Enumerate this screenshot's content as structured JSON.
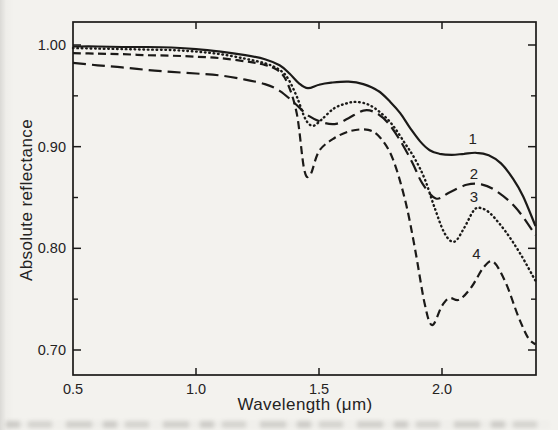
{
  "figure": {
    "kind": "scanned-journal-figure",
    "ink_color": "#1b1a18",
    "paper_color": "#f3f2ee"
  },
  "chart_data": {
    "type": "line",
    "title": "",
    "xlabel": "Wavelength (μm)",
    "ylabel": "Absolute reflectance",
    "xlim": [
      0.5,
      2.38
    ],
    "ylim": [
      0.675,
      1.023
    ],
    "grid": false,
    "legend_position": "inline-numbered-curve-labels",
    "x_ticks": {
      "labeled_values": [
        0.5,
        1.0,
        1.5,
        2.0
      ],
      "labels": [
        "0.5",
        "1.0",
        "1.5",
        "2.0"
      ],
      "mark_values": [
        1.0,
        1.5,
        2.0
      ],
      "marks_on": [
        "bottom",
        "top"
      ]
    },
    "y_ticks": {
      "labeled_values": [
        1.0,
        0.9,
        0.8,
        0.7
      ],
      "labels": [
        "1.00",
        "0.90",
        "0.80",
        "0.70"
      ],
      "minor_values": [
        0.95,
        0.85,
        0.75
      ],
      "marks_on": [
        "left",
        "right"
      ]
    },
    "series": [
      {
        "name": "1",
        "line_style": "solid",
        "label_pos": {
          "x": 2.125,
          "y": 0.9075
        },
        "points": [
          [
            0.5,
            0.9985
          ],
          [
            0.6,
            0.9985
          ],
          [
            0.7,
            0.998
          ],
          [
            0.8,
            0.998
          ],
          [
            0.9,
            0.9975
          ],
          [
            1.0,
            0.996
          ],
          [
            1.1,
            0.9935
          ],
          [
            1.2,
            0.99
          ],
          [
            1.28,
            0.986
          ],
          [
            1.34,
            0.98
          ],
          [
            1.38,
            0.972
          ],
          [
            1.42,
            0.962
          ],
          [
            1.455,
            0.9575
          ],
          [
            1.5,
            0.961
          ],
          [
            1.55,
            0.963
          ],
          [
            1.62,
            0.964
          ],
          [
            1.68,
            0.9615
          ],
          [
            1.74,
            0.955
          ],
          [
            1.79,
            0.944
          ],
          [
            1.83,
            0.933
          ],
          [
            1.87,
            0.9185
          ],
          [
            1.91,
            0.9055
          ],
          [
            1.95,
            0.8965
          ],
          [
            1.99,
            0.893
          ],
          [
            2.04,
            0.892
          ],
          [
            2.09,
            0.893
          ],
          [
            2.14,
            0.894
          ],
          [
            2.19,
            0.8915
          ],
          [
            2.24,
            0.8835
          ],
          [
            2.29,
            0.868
          ],
          [
            2.33,
            0.851
          ],
          [
            2.38,
            0.822
          ]
        ]
      },
      {
        "name": "2",
        "line_style": "long-dash",
        "label_pos": {
          "x": 2.13,
          "y": 0.873
        },
        "points": [
          [
            0.5,
            0.9825
          ],
          [
            0.6,
            0.98
          ],
          [
            0.7,
            0.978
          ],
          [
            0.8,
            0.9755
          ],
          [
            0.9,
            0.9735
          ],
          [
            1.0,
            0.972
          ],
          [
            1.1,
            0.97
          ],
          [
            1.2,
            0.966
          ],
          [
            1.28,
            0.9615
          ],
          [
            1.34,
            0.955
          ],
          [
            1.4,
            0.943
          ],
          [
            1.46,
            0.93
          ],
          [
            1.52,
            0.9235
          ],
          [
            1.57,
            0.9225
          ],
          [
            1.62,
            0.928
          ],
          [
            1.68,
            0.9355
          ],
          [
            1.73,
            0.9335
          ],
          [
            1.78,
            0.9235
          ],
          [
            1.83,
            0.906
          ],
          [
            1.88,
            0.884
          ],
          [
            1.92,
            0.864
          ],
          [
            1.975,
            0.849
          ],
          [
            2.03,
            0.855
          ],
          [
            2.1,
            0.8625
          ],
          [
            2.16,
            0.863
          ],
          [
            2.22,
            0.8565
          ],
          [
            2.3,
            0.84
          ],
          [
            2.38,
            0.813
          ]
        ]
      },
      {
        "name": "3",
        "line_style": "dotted",
        "label_pos": {
          "x": 2.13,
          "y": 0.8505
        },
        "points": [
          [
            0.5,
            0.997
          ],
          [
            0.6,
            0.9965
          ],
          [
            0.7,
            0.996
          ],
          [
            0.8,
            0.9955
          ],
          [
            0.9,
            0.995
          ],
          [
            1.0,
            0.9935
          ],
          [
            1.1,
            0.991
          ],
          [
            1.2,
            0.9865
          ],
          [
            1.28,
            0.982
          ],
          [
            1.33,
            0.977
          ],
          [
            1.37,
            0.9685
          ],
          [
            1.41,
            0.949
          ],
          [
            1.445,
            0.927
          ],
          [
            1.475,
            0.9205
          ],
          [
            1.51,
            0.9265
          ],
          [
            1.56,
            0.9375
          ],
          [
            1.61,
            0.9425
          ],
          [
            1.65,
            0.944
          ],
          [
            1.7,
            0.9415
          ],
          [
            1.75,
            0.9335
          ],
          [
            1.8,
            0.921
          ],
          [
            1.85,
            0.903
          ],
          [
            1.89,
            0.888
          ],
          [
            1.93,
            0.868
          ],
          [
            1.97,
            0.84
          ],
          [
            2.01,
            0.815
          ],
          [
            2.05,
            0.8065
          ],
          [
            2.09,
            0.82
          ],
          [
            2.13,
            0.8375
          ],
          [
            2.16,
            0.8395
          ],
          [
            2.2,
            0.8335
          ],
          [
            2.26,
            0.816
          ],
          [
            2.32,
            0.794
          ],
          [
            2.38,
            0.768
          ]
        ]
      },
      {
        "name": "4",
        "line_style": "dash",
        "label_pos": {
          "x": 2.14,
          "y": 0.7945
        },
        "points": [
          [
            0.5,
            0.992
          ],
          [
            0.6,
            0.9915
          ],
          [
            0.7,
            0.991
          ],
          [
            0.8,
            0.99
          ],
          [
            0.9,
            0.9895
          ],
          [
            1.0,
            0.9885
          ],
          [
            1.1,
            0.987
          ],
          [
            1.2,
            0.984
          ],
          [
            1.27,
            0.981
          ],
          [
            1.33,
            0.9755
          ],
          [
            1.37,
            0.9635
          ],
          [
            1.41,
            0.932
          ],
          [
            1.44,
            0.8775
          ],
          [
            1.465,
            0.8725
          ],
          [
            1.5,
            0.8955
          ],
          [
            1.56,
            0.908
          ],
          [
            1.63,
            0.9155
          ],
          [
            1.7,
            0.9165
          ],
          [
            1.75,
            0.9085
          ],
          [
            1.8,
            0.888
          ],
          [
            1.85,
            0.8475
          ],
          [
            1.89,
            0.8
          ],
          [
            1.93,
            0.745
          ],
          [
            1.96,
            0.7245
          ],
          [
            2.0,
            0.7435
          ],
          [
            2.03,
            0.751
          ],
          [
            2.07,
            0.7495
          ],
          [
            2.12,
            0.762
          ],
          [
            2.17,
            0.7815
          ],
          [
            2.21,
            0.7865
          ],
          [
            2.26,
            0.7655
          ],
          [
            2.31,
            0.733
          ],
          [
            2.35,
            0.712
          ],
          [
            2.38,
            0.7055
          ]
        ]
      }
    ]
  }
}
